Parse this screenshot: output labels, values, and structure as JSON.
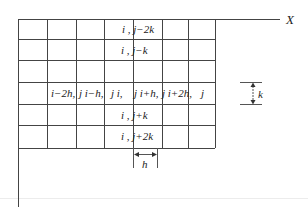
{
  "diagram": {
    "axes": {
      "x_label": "X",
      "y_label": "Y"
    },
    "grid": {
      "columns": 7,
      "rows": 6,
      "line_color": "#444444"
    },
    "node_labels": {
      "top2": "i , j−2k",
      "top1": "i , j−k",
      "mid_left2": "i−2h, j",
      "mid_left1": "i−h, j",
      "mid_center": "i, j",
      "mid_right1": "i+h, j",
      "mid_right2": "i+2h, j",
      "bot1": "i , j+k",
      "bot2": "i , j+2k"
    },
    "row_labels_split": {
      "a": "i−2h,",
      "b": "j i−h,",
      "c": "j i,",
      "d": "j i+h,",
      "e": "j i+2h,",
      "f": "j"
    },
    "dimensions": {
      "vertical_step": "k",
      "horizontal_step": "h"
    }
  }
}
